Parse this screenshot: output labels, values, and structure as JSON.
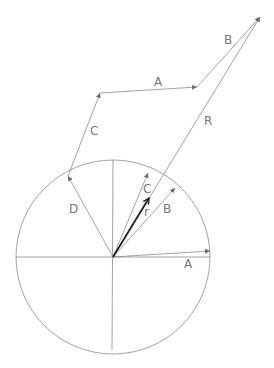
{
  "diagram": {
    "type": "vector-addition-phasor",
    "circle": {
      "cx": 113,
      "cy": 257,
      "r": 97
    },
    "colors": {
      "line": "#8a8a8a",
      "text": "#777777",
      "resultant": "#222222"
    },
    "labels": {
      "A_chain": "A",
      "B_chain": "B",
      "C_chain": "C",
      "R": "R",
      "C_circle": "C",
      "B_circle": "B",
      "A_circle": "A",
      "D_circle": "D",
      "r": "r"
    },
    "vectors_in_circle": [
      {
        "name": "A",
        "to": [
          210,
          251
        ]
      },
      {
        "name": "B",
        "to": [
          175,
          188
        ]
      },
      {
        "name": "C",
        "to": [
          148,
          173
        ]
      },
      {
        "name": "D",
        "to": [
          68,
          176
        ]
      },
      {
        "name": "r",
        "to": [
          149,
          198
        ]
      }
    ],
    "chain": [
      {
        "name": "C",
        "from": [
          68,
          176
        ],
        "to": [
          100,
          93
        ]
      },
      {
        "name": "A",
        "from": [
          100,
          93
        ],
        "to": [
          197,
          87
        ]
      },
      {
        "name": "B",
        "from": [
          197,
          87
        ],
        "to": [
          260,
          17
        ]
      }
    ],
    "resultant": {
      "name": "R",
      "from": [
        113,
        257
      ],
      "to": [
        260,
        17
      ]
    }
  }
}
